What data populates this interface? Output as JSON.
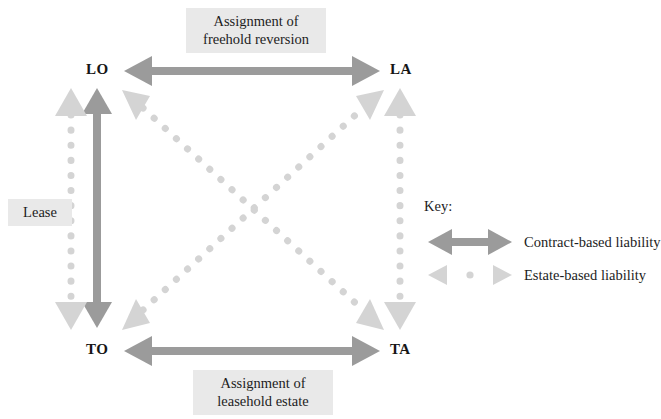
{
  "diagram": {
    "title_text_top": "Assignment of\nfreehold reversion",
    "title_text_bottom": "Assignment of\nleasehold estate",
    "left_label": "Lease",
    "nodes": [
      {
        "id": "LO",
        "label": "LO",
        "position": "top-left"
      },
      {
        "id": "LA",
        "label": "LA",
        "position": "top-right"
      },
      {
        "id": "TO",
        "label": "TO",
        "position": "bottom-left"
      },
      {
        "id": "TA",
        "label": "TA",
        "position": "bottom-right"
      }
    ],
    "edges": [
      {
        "from": "LO",
        "to": "LA",
        "style": "solid",
        "kind": "contract-based",
        "orientation": "horizontal-top"
      },
      {
        "from": "TO",
        "to": "TA",
        "style": "solid",
        "kind": "contract-based",
        "orientation": "horizontal-bottom"
      },
      {
        "from": "LO",
        "to": "TO",
        "style": "solid",
        "kind": "contract-based",
        "orientation": "vertical-left-inner"
      },
      {
        "from": "LO",
        "to": "TO",
        "style": "dotted",
        "kind": "estate-based",
        "orientation": "vertical-left-outer"
      },
      {
        "from": "LA",
        "to": "TA",
        "style": "dotted",
        "kind": "estate-based",
        "orientation": "vertical-right"
      },
      {
        "from": "LO",
        "to": "TA",
        "style": "dotted",
        "kind": "estate-based",
        "orientation": "diagonal-down-right"
      },
      {
        "from": "TO",
        "to": "LA",
        "style": "dotted",
        "kind": "estate-based",
        "orientation": "diagonal-up-right"
      }
    ],
    "key": {
      "title": "Key:",
      "entries": [
        {
          "label": "Contract-based liability",
          "style": "solid",
          "color": "#9b9b9b"
        },
        {
          "label": "Estate-based liability",
          "style": "dotted",
          "color": "#d4d4d4"
        }
      ]
    },
    "colors": {
      "solid_arrow": "#9b9b9b",
      "dotted_arrow": "#d4d4d4",
      "label_background": "#e9e9e9",
      "text": "#1d1d1d",
      "page_background": "#ffffff"
    }
  }
}
